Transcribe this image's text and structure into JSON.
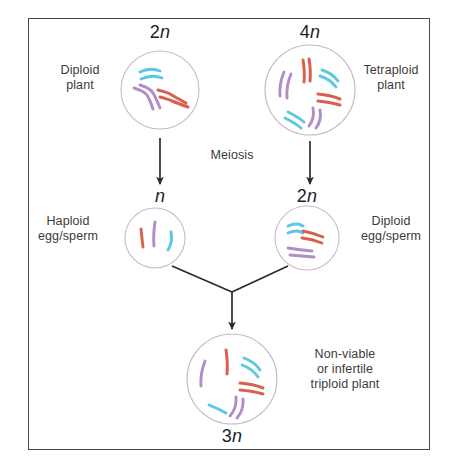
{
  "diagram": {
    "frame": {
      "border_color": "#4a4a4a"
    },
    "palette": {
      "chromosome_cyan": "#5bc8e0",
      "chromosome_red": "#d9604f",
      "chromosome_purple": "#b08cc8",
      "cell_outline": "#c9b8cf",
      "arrow": "#2b2b2b",
      "text": "#3b3b3b"
    },
    "ploidy_labels": {
      "top_left": "2n",
      "top_right": "4n",
      "mid_left": "n",
      "mid_right": "2n",
      "bottom": "3n"
    },
    "text_labels": {
      "diploid_plant": "Diploid\nplant",
      "tetraploid_plant": "Tetraploid\nplant",
      "meiosis": "Meiosis",
      "haploid_gamete": "Haploid\negg/sperm",
      "diploid_gamete": "Diploid\negg/sperm",
      "triploid_result": "Non-viable\nor infertile\ntriploid plant"
    },
    "cells": [
      {
        "name": "diploid-plant-cell",
        "ploidy": "2n",
        "cx": 160,
        "cy": 90,
        "r": 39,
        "chromosome_groups": [
          {
            "color": "cyan",
            "count": 2,
            "region": "top"
          },
          {
            "color": "red",
            "count": 2,
            "region": "right"
          },
          {
            "color": "purple",
            "count": 2,
            "region": "left"
          }
        ]
      },
      {
        "name": "tetraploid-plant-cell",
        "ploidy": "4n",
        "cx": 310,
        "cy": 90,
        "r": 45,
        "chromosome_groups": [
          {
            "color": "red",
            "count": 2,
            "region": "top"
          },
          {
            "color": "cyan",
            "count": 2,
            "region": "upper-right"
          },
          {
            "color": "red",
            "count": 2,
            "region": "right"
          },
          {
            "color": "purple",
            "count": 2,
            "region": "lower-right"
          },
          {
            "color": "cyan",
            "count": 2,
            "region": "bottom"
          },
          {
            "color": "purple",
            "count": 2,
            "region": "left"
          }
        ]
      },
      {
        "name": "haploid-gamete-cell",
        "ploidy": "n",
        "cx": 155,
        "cy": 238,
        "r": 30,
        "chromosome_groups": [
          {
            "color": "red",
            "count": 1,
            "region": "left"
          },
          {
            "color": "purple",
            "count": 1,
            "region": "center"
          },
          {
            "color": "cyan",
            "count": 1,
            "region": "right"
          }
        ]
      },
      {
        "name": "diploid-gamete-cell",
        "ploidy": "2n",
        "cx": 307,
        "cy": 238,
        "r": 32,
        "chromosome_groups": [
          {
            "color": "cyan",
            "count": 2,
            "region": "top-left"
          },
          {
            "color": "red",
            "count": 2,
            "region": "upper-right"
          },
          {
            "color": "purple",
            "count": 2,
            "region": "bottom"
          }
        ]
      },
      {
        "name": "triploid-zygote-cell",
        "ploidy": "3n",
        "cx": 232,
        "cy": 379,
        "r": 45,
        "chromosome_groups": [
          {
            "color": "red",
            "count": 1,
            "region": "top"
          },
          {
            "color": "cyan",
            "count": 2,
            "region": "upper-right"
          },
          {
            "color": "red",
            "count": 2,
            "region": "right"
          },
          {
            "color": "purple",
            "count": 2,
            "region": "lower-right"
          },
          {
            "color": "cyan",
            "count": 1,
            "region": "bottom"
          },
          {
            "color": "purple",
            "count": 1,
            "region": "left"
          }
        ]
      }
    ],
    "arrows": [
      {
        "name": "meiosis-arrow-left",
        "from": [
          160,
          138
        ],
        "to": [
          160,
          184
        ],
        "label": "Meiosis"
      },
      {
        "name": "meiosis-arrow-right",
        "from": [
          310,
          141
        ],
        "to": [
          310,
          184
        ],
        "label": "Meiosis"
      },
      {
        "name": "fusion-arrow-left",
        "from": [
          172,
          266
        ],
        "to": [
          232,
          292
        ],
        "label": ""
      },
      {
        "name": "fusion-arrow-right",
        "from": [
          288,
          266
        ],
        "to": [
          232,
          292
        ],
        "label": ""
      },
      {
        "name": "zygote-arrow",
        "from": [
          232,
          292
        ],
        "to": [
          232,
          329
        ],
        "label": ""
      }
    ]
  }
}
